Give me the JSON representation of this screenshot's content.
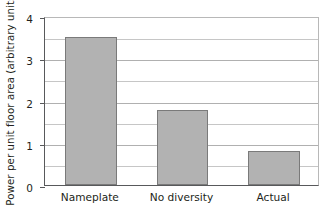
{
  "chart_data": {
    "type": "bar",
    "title": "",
    "xlabel": "",
    "ylabel": "Power per unit floor area (arbitrary units)",
    "categories": [
      "Nameplate",
      "No diversity",
      "Actual"
    ],
    "values": [
      3.5,
      1.78,
      0.8
    ],
    "ylim": [
      0,
      4
    ],
    "yticks": [
      0,
      1,
      2,
      3,
      4
    ],
    "ytick_labels": [
      "0",
      "1",
      "2",
      "3",
      "4"
    ],
    "minor_gridlines": [
      0.5,
      1.5,
      2.5,
      3.5
    ],
    "grid": true,
    "legend": false,
    "legend_position": "none",
    "colors": {
      "bar_fill": "#b2b2b2",
      "bar_edge": "#7a7a7a",
      "axis": "#58595b",
      "gridline": "#c6c6c6",
      "text": "#231f20",
      "background": "#ffffff"
    }
  }
}
